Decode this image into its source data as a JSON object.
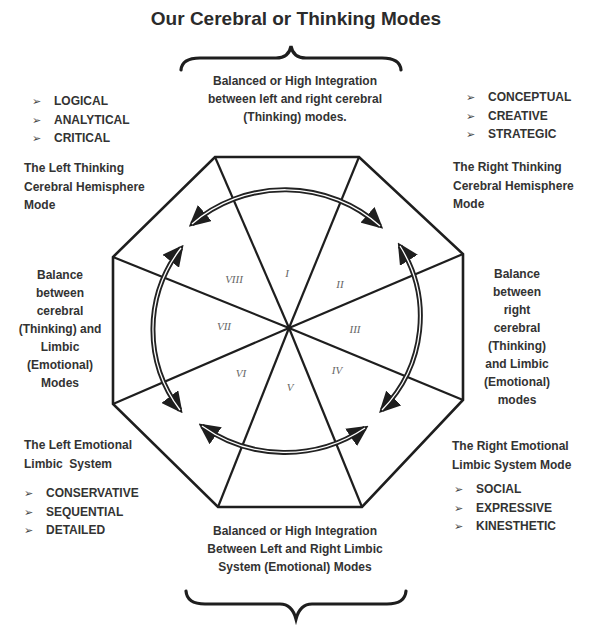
{
  "title": "Our Cerebral or Thinking Modes",
  "top_integration": {
    "lines": [
      "Balanced or High Integration",
      "between left and right cerebral",
      "(Thinking) modes."
    ]
  },
  "bottom_integration": {
    "lines": [
      "Balanced or High Integration",
      "Between Left and Right Limbic",
      "System (Emotional) Modes"
    ]
  },
  "left_thinking": {
    "bullets": [
      "LOGICAL",
      "ANALYTICAL",
      "CRITICAL"
    ],
    "label_lines": [
      "The Left Thinking",
      "Cerebral Hemisphere",
      "Mode"
    ]
  },
  "right_thinking": {
    "bullets": [
      "CONCEPTUAL",
      "CREATIVE",
      "STRATEGIC"
    ],
    "label_lines": [
      "The Right Thinking",
      "Cerebral Hemisphere",
      "Mode"
    ]
  },
  "left_balance": {
    "lines": [
      "Balance",
      "between",
      "cerebral",
      "(Thinking) and",
      "Limbic",
      "(Emotional)",
      "Modes"
    ]
  },
  "right_balance": {
    "lines": [
      "Balance",
      "between",
      "right",
      "cerebral",
      "(Thinking)",
      "and Limbic",
      "(Emotional)",
      "modes"
    ]
  },
  "left_emotional": {
    "label_lines": [
      "The Left Emotional",
      "Limbic  System"
    ],
    "bullets": [
      "CONSERVATIVE",
      "SEQUENTIAL",
      "DETAILED"
    ]
  },
  "right_emotional": {
    "label_lines": [
      "The Right Emotional",
      "Limbic System Mode"
    ],
    "bullets": [
      "SOCIAL",
      "EXPRESSIVE",
      "KINESTHETIC"
    ]
  },
  "bullet_glyph": "➢",
  "sectors": [
    "I",
    "II",
    "III",
    "IV",
    "V",
    "VI",
    "VII",
    "VIII"
  ],
  "colors": {
    "line": "#1e1e1e",
    "text": "#333333",
    "roman": "#666666"
  }
}
